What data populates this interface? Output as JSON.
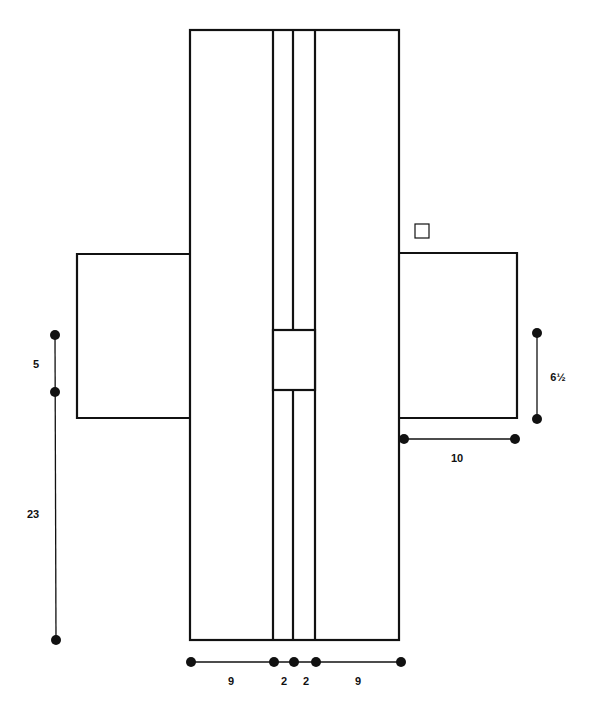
{
  "diagram": {
    "dimensions": {
      "left_upper": "5",
      "left_lower": "23",
      "right_wing_height": "6½",
      "right_wing_width": "10",
      "bottom": [
        "9",
        "2",
        "2",
        "9"
      ]
    }
  }
}
